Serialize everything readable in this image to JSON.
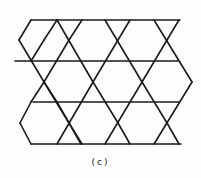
{
  "figure": {
    "caption": "(c)",
    "stroke_color": "#1a1a1a",
    "stroke_width": 1.6,
    "segments": [
      [
        31,
        20,
        180,
        20
      ],
      [
        15,
        61,
        178,
        61
      ],
      [
        33,
        102,
        179,
        102
      ],
      [
        31,
        144,
        181,
        144
      ],
      [
        31,
        20,
        19,
        40
      ],
      [
        19,
        40,
        44,
        82
      ],
      [
        44,
        82,
        69,
        123
      ],
      [
        69,
        123,
        81,
        144
      ],
      [
        20,
        123,
        31,
        102
      ],
      [
        20,
        123,
        31,
        144
      ],
      [
        31,
        102,
        44,
        82
      ],
      [
        44,
        82,
        69,
        40
      ],
      [
        69,
        40,
        82,
        20
      ],
      [
        57,
        20,
        93,
        82
      ],
      [
        93,
        82,
        118,
        123
      ],
      [
        118,
        123,
        130,
        144
      ],
      [
        57,
        144,
        93,
        82
      ],
      [
        93,
        82,
        118,
        40
      ],
      [
        118,
        40,
        130,
        20
      ],
      [
        105,
        20,
        142,
        82
      ],
      [
        142,
        82,
        167,
        123
      ],
      [
        167,
        123,
        179,
        144
      ],
      [
        105,
        144,
        142,
        82
      ],
      [
        142,
        82,
        167,
        40
      ],
      [
        167,
        40,
        179,
        20
      ],
      [
        154,
        20,
        192,
        82
      ],
      [
        154,
        144,
        192,
        82
      ],
      [
        57,
        20,
        44,
        40
      ],
      [
        44,
        40,
        31,
        61
      ],
      [
        82,
        144,
        69,
        123
      ],
      [
        69,
        123,
        57,
        102
      ],
      [
        57,
        102,
        44,
        82
      ]
    ]
  }
}
